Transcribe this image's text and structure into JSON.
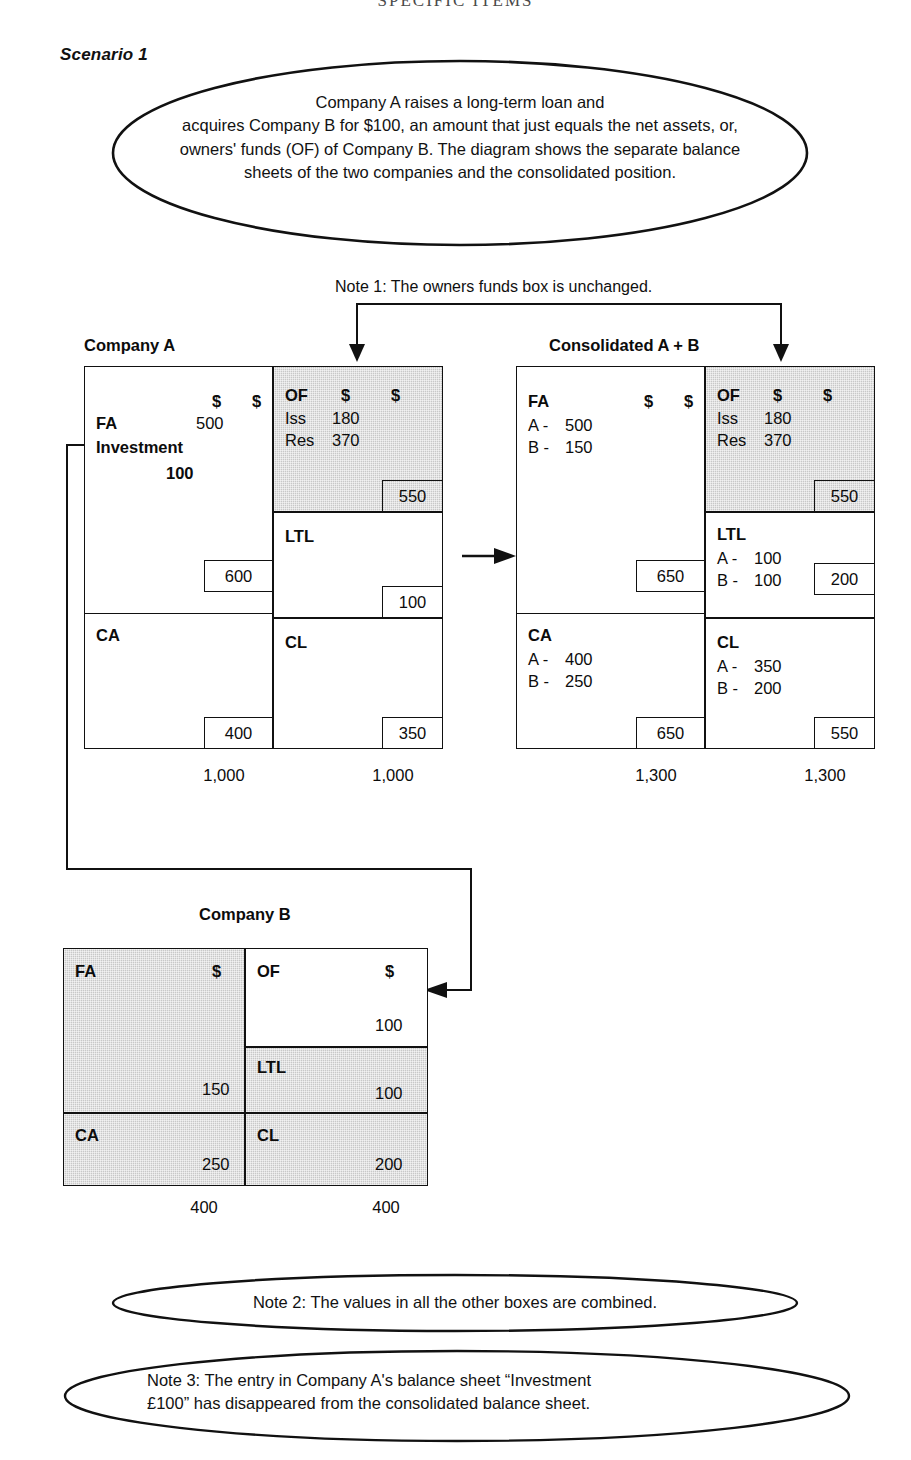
{
  "running_head": "SPECIFIC ITEMS",
  "scenario": {
    "label": "Scenario 1"
  },
  "callout_main": {
    "name": "scenario-callout",
    "lines": [
      "Company A raises a long-term loan and",
      "acquires Company B for $100, an amount that just equals the net assets, or,",
      "owners' funds (OF) of Company B. The diagram shows the separate balance",
      "sheets of the two companies and the consolidated position."
    ]
  },
  "note1": {
    "text": "Note 1: The owners funds box is unchanged."
  },
  "note2": {
    "lines": [
      "Note 2: The values in all the other boxes are combined."
    ]
  },
  "note3": {
    "lines": [
      "Note 3: The entry in Company A's balance sheet “Investment",
      "£100” has disappeared from the consolidated balance sheet."
    ]
  },
  "currency_symbol": "$",
  "company_a": {
    "title": "Company A",
    "assets": {
      "fa_label": "FA",
      "fa_value": "500",
      "investment_label": "Investment",
      "investment_value": "100",
      "fa_subtotal": "600",
      "ca_label": "CA",
      "ca_subtotal": "400",
      "total": "1,000"
    },
    "liabilities": {
      "of_label": "OF",
      "of_rows": [
        {
          "key": "Iss",
          "value": "180"
        },
        {
          "key": "Res",
          "value": "370"
        }
      ],
      "of_subtotal": "550",
      "ltl_label": "LTL",
      "ltl_subtotal": "100",
      "cl_label": "CL",
      "cl_subtotal": "350",
      "total": "1,000"
    }
  },
  "consolidated": {
    "title": "Consolidated A + B",
    "assets": {
      "fa_label": "FA",
      "fa_rows": [
        {
          "key": "A -",
          "value": "500"
        },
        {
          "key": "B -",
          "value": "150"
        }
      ],
      "fa_subtotal": "650",
      "ca_label": "CA",
      "ca_rows": [
        {
          "key": "A -",
          "value": "400"
        },
        {
          "key": "B -",
          "value": "250"
        }
      ],
      "ca_subtotal": "650",
      "total": "1,300"
    },
    "liabilities": {
      "of_label": "OF",
      "of_rows": [
        {
          "key": "Iss",
          "value": "180"
        },
        {
          "key": "Res",
          "value": "370"
        }
      ],
      "of_subtotal": "550",
      "ltl_label": "LTL",
      "ltl_rows": [
        {
          "key": "A -",
          "value": "100"
        },
        {
          "key": "B -",
          "value": "100"
        }
      ],
      "ltl_subtotal": "200",
      "cl_label": "CL",
      "cl_rows": [
        {
          "key": "A -",
          "value": "350"
        },
        {
          "key": "B -",
          "value": "200"
        }
      ],
      "cl_subtotal": "550",
      "total": "1,300"
    }
  },
  "company_b": {
    "title": "Company B",
    "assets": {
      "fa_label": "FA",
      "fa_value": "150",
      "ca_label": "CA",
      "ca_value": "250",
      "total": "400"
    },
    "liabilities": {
      "of_label": "OF",
      "of_value": "100",
      "ltl_label": "LTL",
      "ltl_value": "100",
      "cl_label": "CL",
      "cl_value": "200",
      "total": "400"
    }
  },
  "colors": {
    "shade": "#c8c8c8",
    "stroke": "#111111",
    "paper": "#ffffff"
  }
}
